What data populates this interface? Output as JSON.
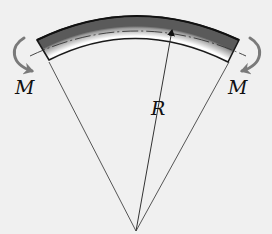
{
  "diagram": {
    "type": "beam-in-pure-bending",
    "labels": {
      "moment_left": "M",
      "moment_right": "M",
      "radius": "R"
    },
    "elements": [
      "curved beam segment with dash-dot neutral axis",
      "left bending moment arrow (curving down and inward)",
      "right bending moment arrow (curving down and inward)",
      "radius of curvature arrow R from center to neutral axis",
      "two radial lines from center of curvature to beam ends"
    ],
    "colors": {
      "background": "#f0f0f0",
      "beam_outline": "#1a1a1a",
      "beam_fill_light": "#ffffff",
      "beam_fill_dark": "#8a8a8a",
      "moment_arrow": "#7a7a7a",
      "radial_lines": "#555555",
      "text": "#111111"
    }
  }
}
